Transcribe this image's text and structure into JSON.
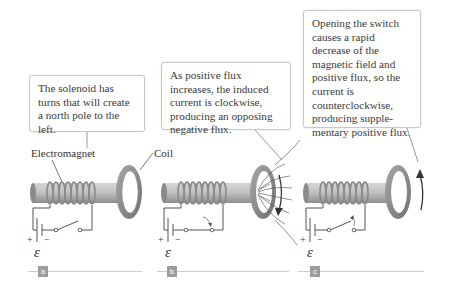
{
  "panels": [
    {
      "id": "a",
      "tag": "a",
      "callout": "The solenoid has turns that will create a north pole to the left.",
      "labels": {
        "electromagnet": "Electromagnet",
        "coil": "Coil"
      },
      "emf_symbol": "ε",
      "plus": "+",
      "minus": "−",
      "switch_state": "open"
    },
    {
      "id": "b",
      "tag": "b",
      "callout": "As positive flux increases, the induced current is clockwise, producing an opposing negative flux.",
      "emf_symbol": "ε",
      "plus": "+",
      "minus": "−",
      "switch_state": "closing",
      "current_direction": "clockwise"
    },
    {
      "id": "c",
      "tag": "c",
      "callout": "Opening the switch causes a rapid decrease of the magnetic field and positive flux, so the current is counterclockwise, producing supple-mentary positive flux.",
      "emf_symbol": "ε",
      "plus": "+",
      "minus": "−",
      "switch_state": "opening",
      "current_direction": "counterclockwise"
    }
  ],
  "colors": {
    "rod": "#b9b9b9",
    "coil_ring": "#8f8f8f",
    "wire": "#555555",
    "callout_border": "#c8c8c8",
    "tag_bg": "#9c9c9c",
    "rule": "#cfcfcf"
  }
}
